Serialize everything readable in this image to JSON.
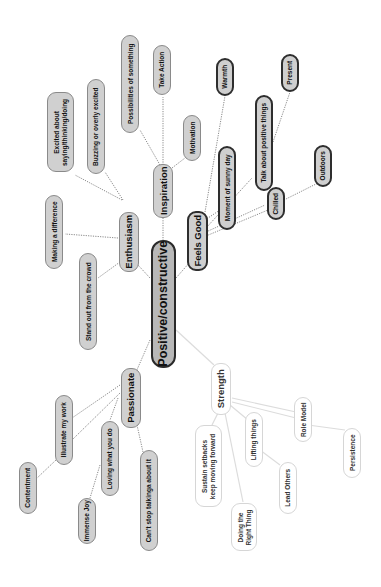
{
  "diagram": {
    "type": "mind-map",
    "orientation": "rotated-90-ccw",
    "colors": {
      "background": "#ffffff",
      "root_fill": "#b8b8b8",
      "gray_fill": "#d0d0d0",
      "dark_border": "#2e2e2e",
      "light_border": "#d6d6d6",
      "dotted_link": "#8a8a8a",
      "light_link": "#dcdcdc"
    },
    "root": {
      "label": "Positive/constructive"
    },
    "branches": {
      "feels_good": {
        "label": "Feels Good",
        "children": [
          "Warmth",
          "Moment of sunny day",
          "Talk about positive things",
          "Chilled"
        ],
        "grandchildren": {
          "talk": "Present",
          "chilled": "Outdoors"
        }
      },
      "inspiration": {
        "label": "Inspiration",
        "children": [
          "Possibilities of something",
          "Take Action",
          "Motivation"
        ]
      },
      "enthusiasm": {
        "label": "Enthusiasm",
        "children": [
          "Excited about saying/thinking/doing",
          "Buzzing or overly excited",
          "Making a difference",
          "Stand out from the crowd"
        ]
      },
      "passionate": {
        "label": "Passionate",
        "children": [
          "Illustrate my work",
          "Loving what you do",
          "Can't stop talkinga about it"
        ],
        "grandchildren": {
          "illustrate": "Contentment",
          "loving": "Immense Joy"
        }
      },
      "strength": {
        "label": "Strength",
        "children": [
          "Sustain setbacks keep moving forward",
          "Doing the Right Thing",
          "Lifting things",
          "Role Model"
        ],
        "grandchildren": {
          "lifting": "Lead Others",
          "role_model": "Persistence"
        }
      }
    },
    "labels": {
      "root": "Positive/constructive",
      "feels_good": "Feels Good",
      "warmth": "Warmth",
      "sunny_day": "Moment of sunny day",
      "talk_positive": "Talk about positive things",
      "present": "Present",
      "chilled": "Chilled",
      "outdoors": "Outdoors",
      "inspiration": "Inspiration",
      "possibilities": "Possibilities of something",
      "take_action": "Take Action",
      "motivation": "Motivation",
      "enthusiasm": "Enthusiasm",
      "excited_line1": "Excited about",
      "excited_line2": "saying/thinking/doing",
      "buzzing": "Buzzing or overly excited",
      "making_difference": "Making a difference",
      "stand_out": "Stand out from the crowd",
      "passionate": "Passionate",
      "illustrate": "Illustrate my work",
      "contentment": "Contentment",
      "loving": "Loving what you do",
      "immense_joy": "Immense Joy",
      "cant_stop": "Can't stop talkinga about it",
      "strength": "Strength",
      "sustain_line1": "Sustain setbacks",
      "sustain_line2": "keep moving forward",
      "right_thing_line1": "Doing the",
      "right_thing_line2": "Right Thing",
      "lifting": "Lifting things",
      "lead_others": "Lead Others",
      "role_model": "Role Model",
      "persistence": "Persistence"
    }
  }
}
